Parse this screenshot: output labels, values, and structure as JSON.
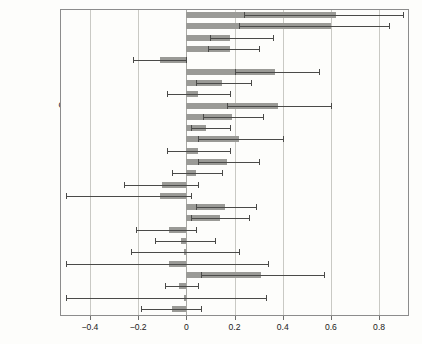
{
  "chart_data": {
    "type": "bar",
    "orientation": "horizontal",
    "title": "",
    "subtitle": "",
    "xlabel": "",
    "ylabel": "",
    "xlim": [
      -0.52,
      0.92
    ],
    "xticks": [
      -0.4,
      -0.2,
      0,
      0.2,
      0.4,
      0.6,
      0.8
    ],
    "xtick_labels": [
      "−0.4",
      "−0.2",
      "0",
      "0.2",
      "0.4",
      "0.6",
      "0.8"
    ],
    "grid": true,
    "grid_axis": "x",
    "legend": "none",
    "zero_reference_line": 0,
    "error_bars": "confidence interval (horizontal whiskers with caps)",
    "bar_color": "#9a9a96",
    "error_color": "#4a4a48",
    "significance_note": "asterisks in category labels denote significance levels",
    "categories": [
      "Alito***",
      "Roberts***",
      "Breyer***",
      "Ginsburg***",
      "Thomas",
      "Souter***",
      "Kennedy**",
      "Scalia",
      "O'Connor***",
      "Stevens***",
      "Rehnquist*",
      "Powell**",
      "Blackmun",
      "Burger*",
      "Marshall",
      "Fortas",
      "Goldberg",
      "White**",
      "Stewart*",
      "Whittaker",
      "Brennan",
      "Harlan",
      "Warren",
      "Clark**",
      "Douglas",
      "Frankfurter",
      "Black"
    ],
    "values": [
      0.62,
      0.6,
      0.18,
      0.18,
      -0.11,
      0.37,
      0.15,
      0.05,
      0.38,
      0.19,
      0.08,
      0.22,
      0.05,
      0.17,
      0.04,
      -0.1,
      -0.11,
      0.16,
      0.14,
      -0.07,
      -0.02,
      -0.01,
      -0.07,
      0.31,
      -0.03,
      -0.01,
      -0.06
    ],
    "ci_low": [
      0.24,
      0.22,
      0.1,
      0.09,
      -0.22,
      0.2,
      0.04,
      -0.08,
      0.17,
      0.07,
      0.02,
      0.05,
      -0.08,
      0.05,
      -0.06,
      -0.26,
      -0.5,
      0.04,
      0.02,
      -0.21,
      -0.13,
      -0.23,
      -0.5,
      0.06,
      -0.09,
      -0.5,
      -0.19
    ],
    "ci_high": [
      0.9,
      0.84,
      0.36,
      0.3,
      0.0,
      0.55,
      0.27,
      0.18,
      0.6,
      0.32,
      0.18,
      0.4,
      0.18,
      0.3,
      0.15,
      0.05,
      0.02,
      0.29,
      0.26,
      0.04,
      0.12,
      0.22,
      0.34,
      0.57,
      0.05,
      0.33,
      0.06
    ]
  }
}
